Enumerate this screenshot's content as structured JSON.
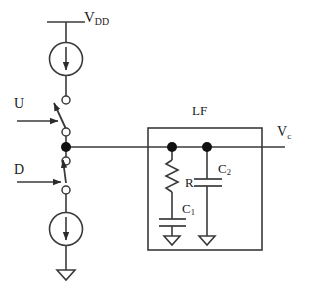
{
  "figure": {
    "type": "circuit-schematic",
    "background_color": "#ffffff",
    "line_color": "#3a3a3a",
    "node_color": "#111111",
    "text_color": "#1a1a1a"
  },
  "labels": {
    "supply": {
      "base": "V",
      "sub": "DD"
    },
    "control_up": "U",
    "control_down": "D",
    "filter_block": "LF",
    "resistor": "R",
    "cap_series": {
      "base": "C",
      "sub": "1"
    },
    "cap_shunt": {
      "base": "C",
      "sub": "2"
    },
    "output": {
      "base": "V",
      "sub": "c"
    }
  },
  "components": {
    "current_source_up": {
      "name": "up-current-source",
      "symbol": "circle-with-down-arrow"
    },
    "current_source_down": {
      "name": "down-current-source",
      "symbol": "circle-with-down-arrow"
    },
    "switch_up": {
      "name": "switch-u",
      "state": "open"
    },
    "switch_down": {
      "name": "switch-d",
      "state": "closed"
    },
    "resistor": {
      "name": "resistor-r",
      "symbol": "zigzag"
    },
    "capacitor_c1": {
      "name": "capacitor-c1",
      "symbol": "parallel-plates"
    },
    "capacitor_c2": {
      "name": "capacitor-c2",
      "symbol": "parallel-plates"
    },
    "ground_main": {
      "name": "ground-main",
      "symbol": "open-triangle"
    },
    "ground_c1": {
      "name": "ground-c1",
      "symbol": "open-triangle"
    },
    "ground_c2": {
      "name": "ground-c2",
      "symbol": "open-triangle"
    },
    "output_node": {
      "name": "charge-pump-output-node",
      "symbol": "filled-dot"
    }
  }
}
